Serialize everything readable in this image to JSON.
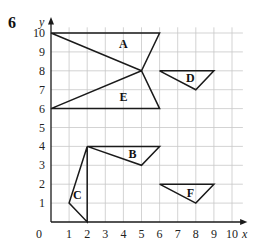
{
  "question_number": "6",
  "axes": {
    "x_label": "x",
    "y_label": "y",
    "x_ticks": [
      "0",
      "1",
      "2",
      "3",
      "4",
      "5",
      "6",
      "7",
      "8",
      "9",
      "10"
    ],
    "y_ticks": [
      "1",
      "2",
      "3",
      "4",
      "5",
      "6",
      "7",
      "8",
      "9",
      "10"
    ],
    "xlim": [
      0,
      10
    ],
    "ylim": [
      0,
      10
    ],
    "grid": true
  },
  "shapes": [
    {
      "label": "A",
      "points": [
        [
          0,
          10
        ],
        [
          6,
          10
        ],
        [
          5,
          8
        ]
      ],
      "label_pos": [
        4.0,
        9.4
      ]
    },
    {
      "label": "B",
      "points": [
        [
          2,
          4
        ],
        [
          6,
          4
        ],
        [
          5,
          3
        ]
      ],
      "label_pos": [
        4.5,
        3.6
      ]
    },
    {
      "label": "C",
      "points": [
        [
          2,
          4
        ],
        [
          1,
          1
        ],
        [
          2,
          0
        ]
      ],
      "label_pos": [
        1.45,
        1.45
      ]
    },
    {
      "label": "D",
      "points": [
        [
          6,
          8
        ],
        [
          9,
          8
        ],
        [
          8,
          7
        ]
      ],
      "label_pos": [
        7.7,
        7.6
      ]
    },
    {
      "label": "E",
      "points": [
        [
          0,
          6
        ],
        [
          5,
          8
        ],
        [
          6,
          6
        ]
      ],
      "label_pos": [
        4.0,
        6.6
      ]
    },
    {
      "label": "F",
      "points": [
        [
          6,
          2
        ],
        [
          9,
          2
        ],
        [
          8,
          1
        ]
      ],
      "label_pos": [
        7.7,
        1.55
      ]
    }
  ],
  "colors": {
    "grid": "#c8c8c8",
    "line": "#1a1a1a"
  }
}
